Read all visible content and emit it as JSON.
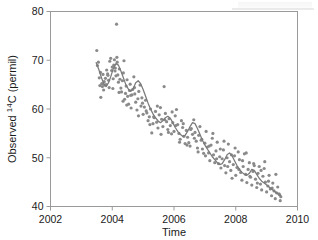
{
  "chart_data": {
    "type": "scatter",
    "title": "",
    "xlabel": "Time",
    "ylabel_prefix": "Observed ",
    "ylabel_sup": "14",
    "ylabel_suffix": "C (permil)",
    "ylabel_full": "Observed 14C (permil)",
    "xlim": [
      2002,
      2010
    ],
    "ylim": [
      40,
      80
    ],
    "xticks": [
      2002,
      2004,
      2006,
      2008,
      2010
    ],
    "yticks": [
      40,
      50,
      60,
      70,
      80
    ],
    "xtick_labels": [
      "2002",
      "2004",
      "2006",
      "2008",
      "2010"
    ],
    "ytick_labels": [
      "40",
      "50",
      "60",
      "70",
      "80"
    ],
    "grid": false,
    "legend": "none",
    "point_color": "#8a8a8a",
    "line_color": "#7a7a7a",
    "axis_color": "#9a9a9a",
    "marker_size": 1.6,
    "frame": "box",
    "series": [
      {
        "name": "Observed 14C",
        "kind": "scatter",
        "x": [
          2003.5,
          2003.52,
          2003.55,
          2003.58,
          2003.6,
          2003.63,
          2003.66,
          2003.68,
          2003.7,
          2003.72,
          2003.75,
          2003.78,
          2003.8,
          2003.82,
          2003.85,
          2003.88,
          2003.9,
          2003.92,
          2003.95,
          2003.98,
          2004.0,
          2004.03,
          2004.05,
          2004.07,
          2004.1,
          2004.12,
          2004.14,
          2004.16,
          2004.18,
          2004.2,
          2004.23,
          2004.25,
          2004.28,
          2004.3,
          2004.33,
          2004.36,
          2004.38,
          2004.4,
          2004.43,
          2004.45,
          2004.48,
          2004.5,
          2004.53,
          2004.56,
          2004.58,
          2004.61,
          2004.64,
          2004.66,
          2004.7,
          2004.73,
          2004.76,
          2004.8,
          2004.83,
          2004.86,
          2004.9,
          2004.93,
          2004.96,
          2005.0,
          2005.04,
          2005.08,
          2005.12,
          2005.16,
          2005.2,
          2005.24,
          2005.28,
          2005.32,
          2005.36,
          2005.4,
          2005.44,
          2005.48,
          2005.52,
          2005.56,
          2005.6,
          2005.64,
          2005.68,
          2005.72,
          2005.76,
          2005.8,
          2005.84,
          2005.88,
          2005.92,
          2005.96,
          2006.0,
          2006.04,
          2006.08,
          2006.12,
          2006.16,
          2006.2,
          2006.24,
          2006.28,
          2006.32,
          2006.36,
          2006.4,
          2006.44,
          2006.48,
          2006.52,
          2006.56,
          2006.6,
          2006.64,
          2006.68,
          2006.72,
          2006.76,
          2006.8,
          2006.84,
          2006.88,
          2006.92,
          2006.96,
          2007.0,
          2007.04,
          2007.08,
          2007.12,
          2007.16,
          2007.2,
          2007.24,
          2007.28,
          2007.32,
          2007.36,
          2007.4,
          2007.44,
          2007.48,
          2007.52,
          2007.56,
          2007.6,
          2007.64,
          2007.68,
          2007.72,
          2007.76,
          2007.8,
          2007.84,
          2007.88,
          2007.92,
          2007.96,
          2008.0,
          2008.04,
          2008.08,
          2008.12,
          2008.16,
          2008.2,
          2008.24,
          2008.28,
          2008.32,
          2008.36,
          2008.4,
          2008.44,
          2008.48,
          2008.52,
          2008.56,
          2008.6,
          2008.64,
          2008.68,
          2008.72,
          2008.76,
          2008.8,
          2008.84,
          2008.88,
          2008.92,
          2008.96,
          2009.0,
          2009.04,
          2009.08,
          2009.12,
          2009.16,
          2009.2,
          2009.24,
          2009.28,
          2009.32,
          2009.36,
          2009.4,
          2009.44,
          2009.46,
          2003.62,
          2003.74,
          2003.86,
          2004.02,
          2004.09,
          2004.22,
          2004.35,
          2004.47,
          2004.6,
          2004.72,
          2004.85,
          2004.98,
          2005.1,
          2005.22,
          2005.34,
          2005.46,
          2005.58,
          2005.7,
          2005.82,
          2005.94,
          2006.06,
          2006.18,
          2006.3,
          2006.42,
          2006.54,
          2006.66,
          2006.78,
          2006.9,
          2007.02,
          2007.14,
          2007.26,
          2007.38,
          2007.5,
          2007.62,
          2007.74,
          2007.86,
          2007.98,
          2008.1,
          2008.22,
          2008.34,
          2008.46,
          2008.58,
          2008.7,
          2008.82,
          2008.94,
          2009.06,
          2009.18,
          2009.3,
          2009.42,
          2004.15
        ],
        "y": [
          72.0,
          68.9,
          69.6,
          66.4,
          64.8,
          62.4,
          65.2,
          64.6,
          67.1,
          63.9,
          64.9,
          66.3,
          65.0,
          68.0,
          67.2,
          65.9,
          64.4,
          69.8,
          70.4,
          67.9,
          68.6,
          66.2,
          69.0,
          70.1,
          68.4,
          66.8,
          77.4,
          69.6,
          67.0,
          65.5,
          68.2,
          66.1,
          64.3,
          63.5,
          65.8,
          67.4,
          69.9,
          62.0,
          63.2,
          64.7,
          66.0,
          62.6,
          61.0,
          63.8,
          65.1,
          60.2,
          62.9,
          64.0,
          66.6,
          63.1,
          61.4,
          59.8,
          62.1,
          63.6,
          64.9,
          60.6,
          62.3,
          58.9,
          60.4,
          61.8,
          59.2,
          57.6,
          58.4,
          60.0,
          55.1,
          57.0,
          58.2,
          59.5,
          57.3,
          56.1,
          58.8,
          60.3,
          57.9,
          56.4,
          64.6,
          59.1,
          57.4,
          55.8,
          58.0,
          56.6,
          54.9,
          57.2,
          55.4,
          58.6,
          59.9,
          56.8,
          55.0,
          53.8,
          57.6,
          56.2,
          54.4,
          52.9,
          55.6,
          54.2,
          53.1,
          52.4,
          56.0,
          54.8,
          57.8,
          55.2,
          53.4,
          52.0,
          54.6,
          56.4,
          53.6,
          51.8,
          50.9,
          53.0,
          55.4,
          52.2,
          51.0,
          49.4,
          52.6,
          54.0,
          50.6,
          49.0,
          51.4,
          53.2,
          48.8,
          50.2,
          47.9,
          49.8,
          51.6,
          48.4,
          46.9,
          50.0,
          52.8,
          49.2,
          47.4,
          45.8,
          48.6,
          50.4,
          46.4,
          48.0,
          51.2,
          49.6,
          47.0,
          45.4,
          48.2,
          50.8,
          46.6,
          44.9,
          47.6,
          49.0,
          46.0,
          44.4,
          47.2,
          48.4,
          45.6,
          43.9,
          46.8,
          48.2,
          44.6,
          43.4,
          46.2,
          47.8,
          45.0,
          43.0,
          44.2,
          46.4,
          43.6,
          42.2,
          44.8,
          43.2,
          41.6,
          42.8,
          44.0,
          42.6,
          41.2,
          42.0,
          67.5,
          65.6,
          66.9,
          64.2,
          67.8,
          63.4,
          61.6,
          60.8,
          62.8,
          64.4,
          58.6,
          61.2,
          59.6,
          56.8,
          58.4,
          60.6,
          54.8,
          57.8,
          55.2,
          59.4,
          56.6,
          53.2,
          57.0,
          52.6,
          55.8,
          54.0,
          51.2,
          53.8,
          50.4,
          52.4,
          55.0,
          49.8,
          51.8,
          53.4,
          48.2,
          50.6,
          52.0,
          47.6,
          49.4,
          51.0,
          46.2,
          48.8,
          44.8,
          47.4,
          49.2,
          45.2,
          43.8,
          46.6,
          42.4,
          70.6
        ]
      },
      {
        "name": "Smoothed trend",
        "kind": "line",
        "x": [
          2003.48,
          2003.56,
          2003.64,
          2003.72,
          2003.8,
          2003.88,
          2003.96,
          2004.04,
          2004.12,
          2004.2,
          2004.28,
          2004.36,
          2004.44,
          2004.52,
          2004.6,
          2004.68,
          2004.76,
          2004.84,
          2004.92,
          2005.0,
          2005.08,
          2005.16,
          2005.24,
          2005.32,
          2005.4,
          2005.48,
          2005.56,
          2005.64,
          2005.72,
          2005.8,
          2005.88,
          2005.96,
          2006.04,
          2006.12,
          2006.2,
          2006.28,
          2006.36,
          2006.44,
          2006.52,
          2006.6,
          2006.68,
          2006.76,
          2006.84,
          2006.92,
          2007.0,
          2007.08,
          2007.16,
          2007.24,
          2007.32,
          2007.4,
          2007.48,
          2007.56,
          2007.64,
          2007.72,
          2007.8,
          2007.88,
          2007.96,
          2008.04,
          2008.12,
          2008.2,
          2008.28,
          2008.36,
          2008.44,
          2008.52,
          2008.6,
          2008.68,
          2008.76,
          2008.84,
          2008.92,
          2009.0,
          2009.08,
          2009.16,
          2009.24,
          2009.32,
          2009.4,
          2009.46
        ],
        "y": [
          69.5,
          68.2,
          66.6,
          65.2,
          64.6,
          65.4,
          66.8,
          68.4,
          69.3,
          69.0,
          67.8,
          66.4,
          65.0,
          64.1,
          63.6,
          64.2,
          65.4,
          65.8,
          65.2,
          64.0,
          62.6,
          61.2,
          60.0,
          59.0,
          58.2,
          57.6,
          57.2,
          57.6,
          58.2,
          58.5,
          58.1,
          57.2,
          56.2,
          55.4,
          54.8,
          54.4,
          54.6,
          55.4,
          56.4,
          57.2,
          57.0,
          56.0,
          54.8,
          53.6,
          52.6,
          51.8,
          51.0,
          50.2,
          49.6,
          49.0,
          48.6,
          48.8,
          49.6,
          50.6,
          51.0,
          50.4,
          49.4,
          48.4,
          47.6,
          47.0,
          46.6,
          46.4,
          46.8,
          47.6,
          47.4,
          46.6,
          45.8,
          45.2,
          44.8,
          44.4,
          44.0,
          43.6,
          43.2,
          42.8,
          42.4,
          42.3
        ]
      }
    ]
  }
}
